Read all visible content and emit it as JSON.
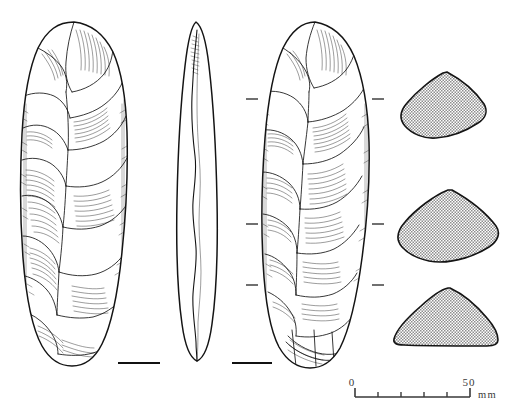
{
  "figure": {
    "kind": "archaeological-lithic-illustration",
    "background_color": "#ffffff",
    "ink_color": "#141414"
  },
  "views": [
    {
      "id": "view-dorsal",
      "label": "dorsal face",
      "position": "left",
      "bbox": [
        22,
        22,
        106,
        344
      ],
      "has_base_bar": true
    },
    {
      "id": "view-profile",
      "label": "profile / side view",
      "position": "centre",
      "bbox": [
        168,
        22,
        56,
        340
      ],
      "has_base_bar": false
    },
    {
      "id": "view-ventral",
      "label": "ventral face",
      "position": "right",
      "bbox": [
        262,
        22,
        110,
        345
      ],
      "has_base_bar": true
    }
  ],
  "cross_sections": [
    {
      "id": "cross-section-upper",
      "label": "upper section",
      "shape": "lenticular",
      "cy": 108
    },
    {
      "id": "cross-section-middle",
      "label": "middle section",
      "shape": "rhomboid-lens",
      "cy": 228
    },
    {
      "id": "cross-section-lower",
      "label": "lower section",
      "shape": "plano-convex dome",
      "cy": 325
    }
  ],
  "section_marks": [
    {
      "y": 99,
      "left_x": 246,
      "right_x": 372
    },
    {
      "y": 224,
      "left_x": 246,
      "right_x": 372
    },
    {
      "y": 285,
      "left_x": 246,
      "right_x": 372
    }
  ],
  "base_bars": [
    {
      "id": "base-bar-dorsal",
      "x1": 118,
      "x2": 160,
      "y": 363
    },
    {
      "id": "base-bar-ventral",
      "x1": 232,
      "x2": 272,
      "y": 363
    }
  ],
  "scale_bar": {
    "start_label": "0",
    "end_label": "50",
    "unit_label": "mm",
    "x_start": 355,
    "x_end": 470,
    "y": 395,
    "divisions": 5,
    "total_mm": 50,
    "color": "#3a3a3a"
  }
}
